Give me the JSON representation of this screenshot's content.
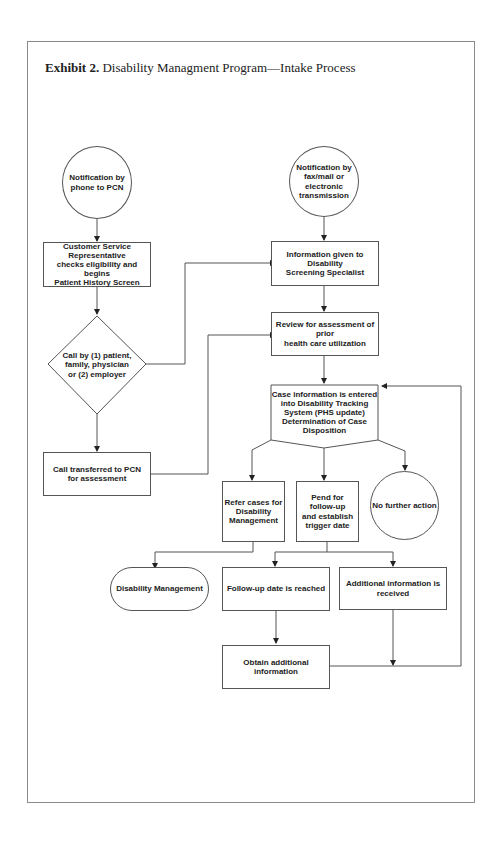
{
  "title": {
    "bold": "Exhibit 2.",
    "text": "Disability Managment Program—Intake Process"
  },
  "nodes": {
    "start_phone": "Notification by\nphone to PCN",
    "start_fax": "Notification by\nfax/mail or\nelectronic\ntransmission",
    "csr": "Customer Service\nRepresentative\nchecks eligibility and begins\nPatient History Screen",
    "info_given": "Information given to\nDisability\nScreening Specialist",
    "decision_call": "Call by (1) patient,\nfamily, physician\nor (2) employer",
    "review": "Review for assessment of\nprior\nhealth care utilization",
    "case_entered": "Case information is entered\ninto Disability Tracking\nSystem (PHS update)\nDetermination of Case\nDisposition",
    "transfer": "Call transferred to PCN\nfor assessment",
    "refer": "Refer cases for\nDisability\nManagement",
    "pend": "Pend for\nfollow-up\nand establish\ntrigger date",
    "no_action": "No further action",
    "dm": "Disability Management",
    "followup_reached": "Follow-up date is reached",
    "additional_received": "Additional information is\nreceived",
    "obtain": "Obtain additional\ninformation"
  }
}
